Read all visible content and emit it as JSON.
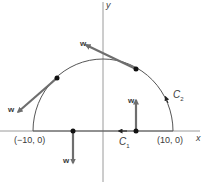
{
  "diagram": {
    "axes": {
      "x_label": "x",
      "y_label": "y"
    },
    "points": {
      "left": "(−10, 0)",
      "right": "(10, 0)"
    },
    "curves": {
      "c1": "C",
      "c1_sub": "1",
      "c2": "C",
      "c2_sub": "2"
    },
    "vectors": [
      {
        "label": "w",
        "position": "upper-left arc"
      },
      {
        "label": "w",
        "position": "left arc"
      },
      {
        "label": "w",
        "position": "x-axis left, downward"
      },
      {
        "label": "w",
        "position": "x-axis right, upward"
      }
    ],
    "colors": {
      "axis": "#9a9a9a",
      "curve": "#555555",
      "vector": "#6e6e6e",
      "dot": "#111111"
    }
  }
}
